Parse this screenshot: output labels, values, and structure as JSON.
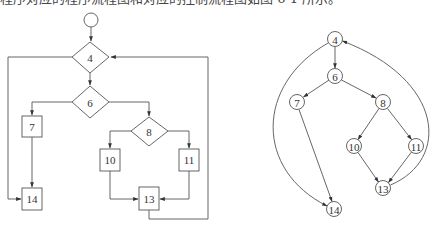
{
  "caption": "程序对应的程序流程图和对应的控制流程图如图 6-1 所示。",
  "flowchart": {
    "start": {
      "cx": 91,
      "cy": 20,
      "r": 7
    },
    "nodes": [
      {
        "id": "4",
        "label": "4",
        "type": "diamond",
        "cx": 90,
        "cy": 57,
        "w": 38,
        "h": 31
      },
      {
        "id": "6",
        "label": "6",
        "type": "diamond",
        "cx": 90,
        "cy": 102,
        "w": 38,
        "h": 32
      },
      {
        "id": "7",
        "label": "7",
        "type": "box",
        "x": 22,
        "y": 116,
        "w": 20,
        "h": 21
      },
      {
        "id": "8",
        "label": "8",
        "type": "diamond",
        "cx": 149,
        "cy": 131,
        "w": 37,
        "h": 29
      },
      {
        "id": "10",
        "label": "10",
        "type": "box",
        "x": 100,
        "y": 149,
        "w": 20,
        "h": 22
      },
      {
        "id": "11",
        "label": "11",
        "type": "box",
        "x": 179,
        "y": 149,
        "w": 20,
        "h": 22
      },
      {
        "id": "13",
        "label": "13",
        "type": "box",
        "x": 139,
        "y": 187,
        "w": 20,
        "h": 23
      },
      {
        "id": "14",
        "label": "14",
        "type": "box",
        "x": 22,
        "y": 188,
        "w": 20,
        "h": 22
      }
    ]
  },
  "control_flow_graph": {
    "node_radius": 7.5,
    "nodes": [
      {
        "id": "4",
        "label": "4",
        "cx": 335,
        "cy": 39
      },
      {
        "id": "6",
        "label": "6",
        "cx": 335,
        "cy": 76
      },
      {
        "id": "7",
        "label": "7",
        "cx": 297,
        "cy": 102
      },
      {
        "id": "8",
        "label": "8",
        "cx": 383,
        "cy": 102
      },
      {
        "id": "10",
        "label": "10",
        "cx": 354,
        "cy": 146
      },
      {
        "id": "11",
        "label": "11",
        "cx": 416,
        "cy": 146
      },
      {
        "id": "13",
        "label": "13",
        "cx": 383,
        "cy": 188
      },
      {
        "id": "14",
        "label": "14",
        "cx": 334,
        "cy": 209
      }
    ],
    "edges": [
      {
        "from": "4",
        "to": "6"
      },
      {
        "from": "6",
        "to": "7"
      },
      {
        "from": "6",
        "to": "8"
      },
      {
        "from": "7",
        "to": "14"
      },
      {
        "from": "8",
        "to": "10"
      },
      {
        "from": "8",
        "to": "11"
      },
      {
        "from": "10",
        "to": "13"
      },
      {
        "from": "11",
        "to": "13"
      },
      {
        "from": "13",
        "to": "4",
        "curved": true
      },
      {
        "from": "4",
        "to": "14",
        "curved": true
      }
    ]
  }
}
